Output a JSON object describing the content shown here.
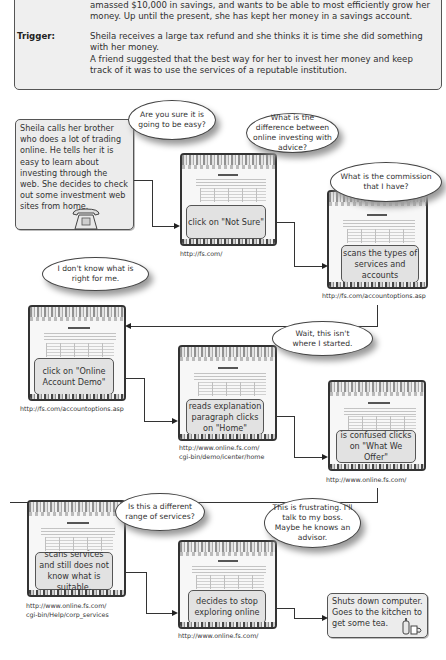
{
  "persona": {
    "intro_lines": [
      "amassed $10,000 in savings, and wants to be able to most efficiently grow her",
      "money. Up until the present, she has kept her money in a savings account."
    ],
    "trigger_label": "Trigger:",
    "trigger_lines": [
      "Sheila receives a large tax refund and she thinks it is time she did something",
      "with her  money.",
      "A friend suggested that the best way for her to invest her money and keep",
      "track of it was to use the services of a reputable institution."
    ]
  },
  "start": {
    "text": "Sheila calls her brother who does a lot of trading online. He tells her it is easy to learn about investing through the web. She decides to check out some investment web sites from home.",
    "icon": "telephone-icon"
  },
  "bubbles": [
    {
      "id": "easy",
      "text": "Are you sure it is going to be easy?"
    },
    {
      "id": "difference",
      "text": "What is the difference between online investing with advice?"
    },
    {
      "id": "commission",
      "text": "What is the commission that I have?"
    },
    {
      "id": "dont-know",
      "text": "I don't know what is right for me."
    },
    {
      "id": "wait",
      "text": "Wait, this isn't where I started."
    },
    {
      "id": "different-range",
      "text": "Is this a different range of services?"
    },
    {
      "id": "frustrating",
      "text": "This is frustrating. I'll talk to my boss. Maybe he knows an advisor."
    }
  ],
  "steps": [
    {
      "action": "click on \"Not Sure\"",
      "url": "http://fs.com/"
    },
    {
      "action": "scans the types of services and accounts",
      "url": "http://fs.com/accountoptions.asp"
    },
    {
      "action": "click on \"Online Account Demo\"",
      "url": "http://fs.com/accountoptions.asp"
    },
    {
      "action": "reads explanation paragraph clicks on \"Home\"",
      "url_lines": [
        "http://www.online.fs.com/",
        "cgi-bin/demo/icenter/home"
      ]
    },
    {
      "action": "is confused clicks on \"What We Offer\"",
      "url": "http://www.online.fs.com/"
    },
    {
      "action": "scans services and still does not know what is suitable.",
      "url_lines": [
        "http://www.online.fs.com/",
        "cgi-bin/Help/corp_services"
      ]
    },
    {
      "action": "decides to stop exploring online",
      "url": "http://www.online.fs.com/"
    }
  ],
  "end": {
    "text": "Shuts down computer. Goes to the kitchen to get some tea.",
    "icon": "teapot-cup-icon"
  },
  "colors": {
    "box_fill": "#ececec",
    "action_fill": "#e2e2e2",
    "border": "#555555",
    "bubble_fill": "#ffffff",
    "shadow": "#9a9a9a"
  }
}
